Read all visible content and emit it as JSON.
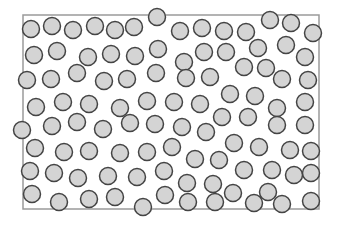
{
  "diagram": {
    "width": 337,
    "height": 227,
    "container": {
      "x": 23,
      "y": 15,
      "width": 296,
      "height": 194,
      "stroke": "#9a9a9a",
      "stroke_width": 1.5
    },
    "particle_style": {
      "radius": 8.5,
      "fill": "#d4d4d4",
      "stroke": "#444444",
      "stroke_width": 1.5
    },
    "particles": [
      [
        31,
        29
      ],
      [
        52,
        26
      ],
      [
        73,
        30
      ],
      [
        95,
        26
      ],
      [
        115,
        30
      ],
      [
        134,
        27
      ],
      [
        157,
        17
      ],
      [
        180,
        31
      ],
      [
        202,
        28
      ],
      [
        224,
        31
      ],
      [
        246,
        32
      ],
      [
        270,
        20
      ],
      [
        291,
        23
      ],
      [
        313,
        33
      ],
      [
        34,
        55
      ],
      [
        57,
        51
      ],
      [
        88,
        57
      ],
      [
        111,
        54
      ],
      [
        135,
        56
      ],
      [
        158,
        49
      ],
      [
        184,
        62
      ],
      [
        204,
        52
      ],
      [
        226,
        52
      ],
      [
        258,
        48
      ],
      [
        286,
        45
      ],
      [
        305,
        57
      ],
      [
        27,
        80
      ],
      [
        51,
        79
      ],
      [
        77,
        73
      ],
      [
        104,
        81
      ],
      [
        127,
        79
      ],
      [
        156,
        73
      ],
      [
        186,
        78
      ],
      [
        210,
        77
      ],
      [
        244,
        67
      ],
      [
        266,
        68
      ],
      [
        282,
        79
      ],
      [
        308,
        80
      ],
      [
        36,
        107
      ],
      [
        63,
        102
      ],
      [
        89,
        104
      ],
      [
        120,
        108
      ],
      [
        147,
        101
      ],
      [
        174,
        102
      ],
      [
        200,
        104
      ],
      [
        230,
        94
      ],
      [
        255,
        96
      ],
      [
        277,
        108
      ],
      [
        305,
        102
      ],
      [
        22,
        130
      ],
      [
        52,
        126
      ],
      [
        77,
        122
      ],
      [
        103,
        129
      ],
      [
        130,
        123
      ],
      [
        155,
        124
      ],
      [
        182,
        127
      ],
      [
        206,
        132
      ],
      [
        222,
        117
      ],
      [
        248,
        117
      ],
      [
        277,
        125
      ],
      [
        305,
        125
      ],
      [
        35,
        148
      ],
      [
        64,
        152
      ],
      [
        89,
        151
      ],
      [
        120,
        153
      ],
      [
        147,
        152
      ],
      [
        172,
        147
      ],
      [
        195,
        159
      ],
      [
        219,
        160
      ],
      [
        234,
        143
      ],
      [
        259,
        147
      ],
      [
        290,
        150
      ],
      [
        311,
        151
      ],
      [
        30,
        171
      ],
      [
        54,
        173
      ],
      [
        78,
        178
      ],
      [
        108,
        176
      ],
      [
        137,
        177
      ],
      [
        164,
        171
      ],
      [
        187,
        183
      ],
      [
        213,
        184
      ],
      [
        244,
        170
      ],
      [
        272,
        170
      ],
      [
        294,
        175
      ],
      [
        311,
        173
      ],
      [
        32,
        194
      ],
      [
        59,
        202
      ],
      [
        89,
        199
      ],
      [
        115,
        197
      ],
      [
        143,
        207
      ],
      [
        165,
        195
      ],
      [
        188,
        202
      ],
      [
        215,
        202
      ],
      [
        233,
        193
      ],
      [
        254,
        203
      ],
      [
        268,
        192
      ],
      [
        282,
        204
      ],
      [
        311,
        201
      ]
    ]
  }
}
